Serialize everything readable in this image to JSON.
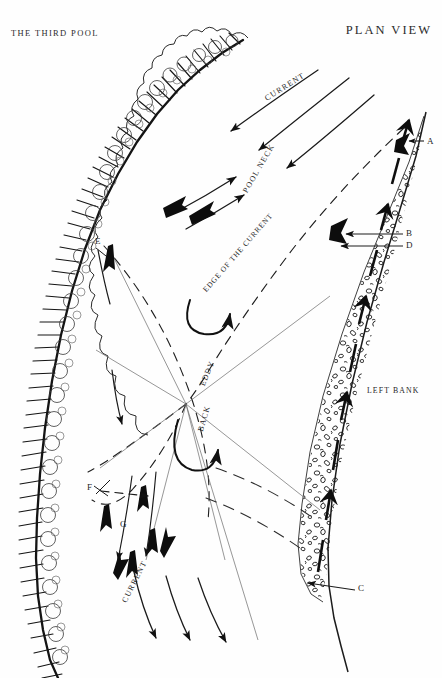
{
  "header": {
    "left_title": "THE THIRD POOL",
    "right_title": "PLAN VIEW"
  },
  "labels": {
    "current_top": "CURRENT",
    "pool_neck": "POOL NECK",
    "edge_of_current": "EDGE OF THE CURRENT",
    "eddy": "EDDY",
    "back": "BACK",
    "left_bank": "LEFT BANK",
    "current_bottom": "CURRENT"
  },
  "points": [
    {
      "id": "A",
      "label": "A"
    },
    {
      "id": "B",
      "label": "B"
    },
    {
      "id": "C",
      "label": "C"
    },
    {
      "id": "D",
      "label": "D"
    },
    {
      "id": "E",
      "label": "E"
    },
    {
      "id": "F",
      "label": "F"
    },
    {
      "id": "G",
      "label": "G"
    }
  ],
  "colors": {
    "ink": "#1a1a1a",
    "paper": "#fefefe",
    "hairline": "#3a3a3a"
  }
}
